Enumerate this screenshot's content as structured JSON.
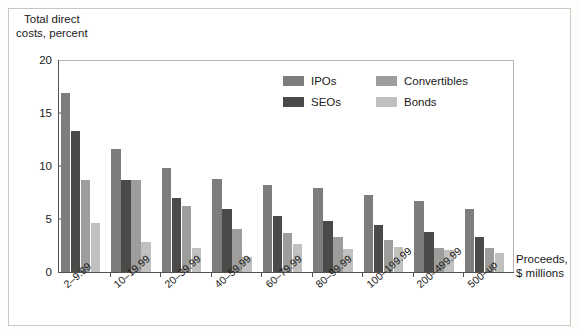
{
  "chart_data": {
    "type": "bar",
    "title": "",
    "ylabel": "Total direct costs, percent",
    "ylabel_line1": "Total direct",
    "ylabel_line2": "costs, percent",
    "xlabel": "Proceeds, $ millions",
    "xlabel_line1": "Proceeds,",
    "xlabel_line2": "$ millions",
    "ylim": [
      0,
      20
    ],
    "yticks": [
      0,
      5,
      10,
      15,
      20
    ],
    "ytick_labels": [
      "0",
      "5",
      "10",
      "15",
      "20"
    ],
    "grid": false,
    "legend_position": "top-center-inside",
    "categories": [
      "2–9.99",
      "10–19.99",
      "20–39.99",
      "40–59.99",
      "60–79.99",
      "80–99.99",
      "100–199.99",
      "200–499.99",
      "500–up"
    ],
    "series": [
      {
        "name": "IPOs",
        "color": "#7d7d7b",
        "values": [
          16.9,
          11.6,
          9.8,
          8.8,
          8.2,
          7.9,
          7.3,
          6.7,
          5.9
        ]
      },
      {
        "name": "SEOs",
        "color": "#4a4a48",
        "values": [
          13.3,
          8.7,
          7.0,
          5.9,
          5.3,
          4.8,
          4.4,
          3.8,
          3.3
        ]
      },
      {
        "name": "Convertibles",
        "color": "#9d9d9b",
        "values": [
          8.7,
          8.7,
          6.2,
          4.1,
          3.7,
          3.3,
          3.0,
          2.3,
          2.3
        ]
      },
      {
        "name": "Bonds",
        "color": "#c0c0be",
        "values": [
          4.6,
          2.8,
          2.3,
          1.4,
          2.6,
          2.2,
          2.4,
          2.1,
          1.8
        ]
      }
    ]
  }
}
